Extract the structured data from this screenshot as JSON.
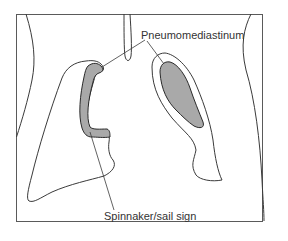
{
  "diagram": {
    "labels": {
      "pneumomediastinum": "Pneumomediastinum",
      "sail_sign": "Spinnaker/sail sign"
    },
    "colors": {
      "line": "#3a3a3a",
      "fill": "#a9a9a9",
      "frame": "#5a5a5a",
      "background": "#ffffff"
    }
  }
}
